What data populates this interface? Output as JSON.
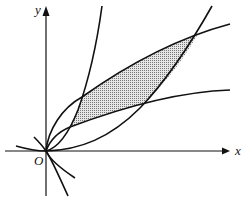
{
  "diagram": {
    "axes": {
      "x_label": "x",
      "y_label": "y",
      "origin_label": "O"
    },
    "curves": [
      "steep parabola",
      "lower parabola",
      "upper root curve",
      "lower root curve"
    ],
    "shaded_region": "region bounded by the four curves",
    "colors": {
      "stroke": "#111111",
      "shade": "#bdbdbd"
    }
  }
}
